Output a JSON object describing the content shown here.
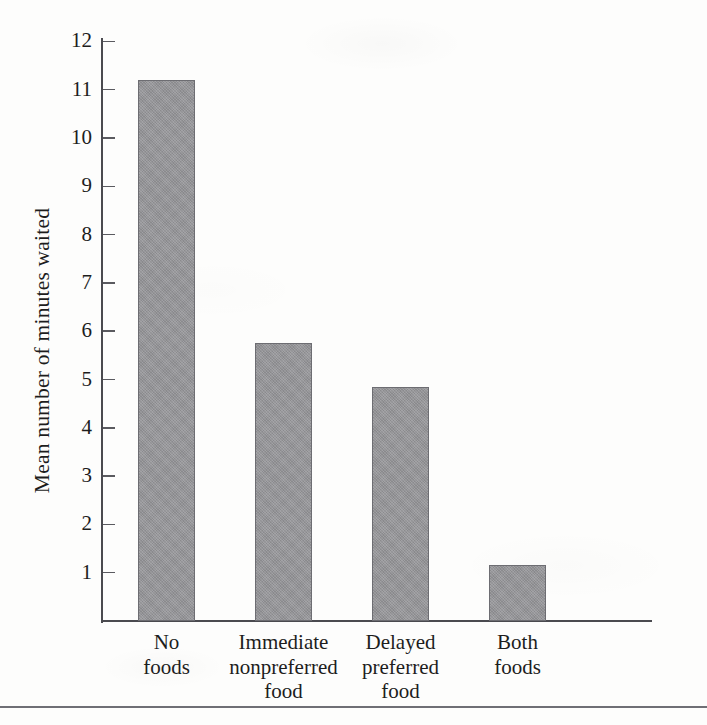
{
  "figure": {
    "background_color": "#fdfdfc",
    "ink_color": "#1d1d1d",
    "axis_color": "#4a4a4f",
    "bar_fill_color": "#919195",
    "bar_border_color": "#6d6d72"
  },
  "chart_data": {
    "type": "bar",
    "title": "",
    "subtitle": "",
    "xlabel": "",
    "ylabel": "Mean number of minutes waited",
    "categories": [
      "No foods",
      "Immediate nonpreferred food",
      "Delayed preferred food",
      "Both foods"
    ],
    "category_lines": [
      [
        "No",
        "foods"
      ],
      [
        "Immediate",
        "nonpreferred",
        "food"
      ],
      [
        "Delayed",
        "preferred",
        "food"
      ],
      [
        "Both",
        "foods"
      ]
    ],
    "values": [
      11.2,
      5.75,
      4.85,
      1.15
    ],
    "ylim": [
      0,
      12.4
    ],
    "yticks": [
      1,
      2,
      3,
      4,
      5,
      6,
      7,
      8,
      9,
      10,
      11,
      12
    ],
    "ytick_labels": [
      "1",
      "2",
      "3",
      "4",
      "5",
      "6",
      "7",
      "8",
      "9",
      "10",
      "11",
      "12"
    ],
    "grid": false,
    "legend": null,
    "legend_position": "none",
    "annotations": []
  },
  "caption": {
    "rule_visible": true,
    "clipped_text": ""
  }
}
